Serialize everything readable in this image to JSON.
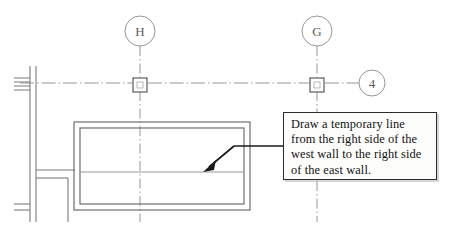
{
  "drawing": {
    "title": "Architectural floor plan with instruction callout",
    "background_color": "#ffffff",
    "line_color": "#6e6e6e",
    "dark_line_color": "#3a3a3a",
    "text_color": "#111111"
  },
  "grid_bubbles": [
    {
      "label": "H",
      "cx": 140,
      "cy": 31,
      "r": 15,
      "orientation": "vertical"
    },
    {
      "label": "G",
      "cx": 317,
      "cy": 31,
      "r": 15,
      "orientation": "vertical"
    },
    {
      "label": "4",
      "cx": 372,
      "cy": 83,
      "r": 13,
      "orientation": "horizontal"
    }
  ],
  "column_symbols": [
    {
      "name": "column-h4",
      "x": 140,
      "y": 85
    },
    {
      "name": "column-g4",
      "x": 317,
      "y": 85
    }
  ],
  "callout": {
    "lines": [
      "Draw a temporary line",
      "from the right side of the",
      "west wall to the right side",
      "of the east wall."
    ],
    "border_color": "#2b2b2b",
    "fill_color": "#fdfdfb"
  },
  "annotations": {
    "leader_label": "leader line with arrowhead pointing into building interior",
    "arrow_tip": {
      "x": 205,
      "y": 170
    },
    "arrow_elbow": {
      "x": 234,
      "y": 146
    }
  },
  "walls": {
    "west_wall_label": "west wall",
    "east_wall_label": "east wall",
    "building_outline": {
      "x": 74,
      "y": 122,
      "width": 176,
      "height": 88
    }
  }
}
